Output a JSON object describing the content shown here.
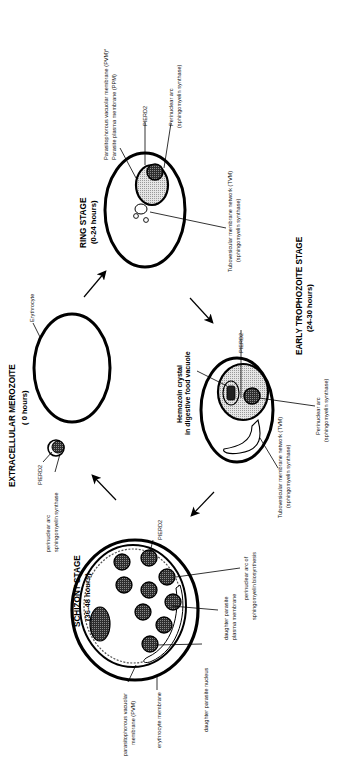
{
  "diagram": {
    "orientation": "rotated 90 degrees counterclockwise",
    "colors": {
      "stroke": "#000000",
      "fill_light": "#dcdcdc",
      "fill_dark": "#3a3a3a",
      "background": "#ffffff"
    },
    "stages": {
      "merozoite": {
        "title": "EXTRACELLULAR MEROZOITE",
        "subtitle": "( 0 hours)",
        "labels": {
          "pierd2": "PIERD2",
          "arc_line1": "perinuclear arc",
          "arc_line2": "sphingomyelin synthase"
        }
      },
      "erythrocyte": {
        "label": "Erythrocyte"
      },
      "ring": {
        "title": "RING STAGE",
        "subtitle": "(0-24 hours)",
        "labels": {
          "pvm_line1": "Parasitophorous vacuolar membrane (PVM)*",
          "pvm_line2": "Parasite plasma membrane (PPM)",
          "pierd2": "PIERD2",
          "arc_line1": "Perinuclear arc",
          "arc_line2": "(sphingomyelin synthase)",
          "tvm_line1": "Tubovesicular membrane network (TVM)",
          "tvm_line2": "(sphingomyelin synthase)"
        }
      },
      "trophozoite": {
        "title": "EARLY TROPHOZOITE STAGE",
        "subtitle": "(24-30 hours)",
        "labels": {
          "hemozoin_line1": "Hemozoin crystal",
          "hemozoin_line2": "in digestive food vacuole",
          "pierd2": "PIERD2",
          "arc_line1": "Perinuclear arc",
          "arc_line2": "(sphingomyelin synthase)",
          "tvm_line1": "Tubovesicular membrane network (TVM)",
          "tvm_line2": "(sphingomyelin synthase)"
        }
      },
      "schizont": {
        "title": "SCHIZONT STAGE",
        "subtitle": "(36-48 hours)",
        "labels": {
          "pierd2": "PIERD2",
          "pvm_line1": "parasitophorous vacuolar",
          "pvm_line2": "membrane (PVM)",
          "erythrocyte_membrane": "erythrocyte membrane",
          "daughter_nucleus": "daughter parasite nucleus",
          "daughter_ppm_line1": "daughter parasite",
          "daughter_ppm_line2": "plasma membrane",
          "arc_line1": "perinuclear arc of",
          "arc_line2": "sphingomyelin biosynthesis",
          "tvm_line1": "Tubovesicular membrane network (TVM)",
          "tvm_line2": "(sphingomyelin synthase)"
        }
      }
    }
  }
}
